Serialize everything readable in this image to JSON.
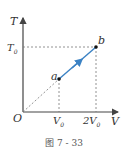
{
  "diagram": {
    "type": "T-V process diagram",
    "axes": {
      "y_label": "T",
      "x_label": "V",
      "origin_label": "O"
    },
    "ticks": {
      "y": [
        {
          "label": "T",
          "subscript": "0"
        }
      ],
      "x": [
        {
          "label": "V",
          "subscript": "0"
        },
        {
          "label": "2V",
          "subscript": "0"
        }
      ]
    },
    "points": [
      {
        "name": "a",
        "V": "V0",
        "T": "T0/2"
      },
      {
        "name": "b",
        "V": "2V0",
        "T": "T0"
      }
    ],
    "process": {
      "from": "a",
      "to": "b",
      "color": "#3b82c4"
    },
    "caption": "图 7 - 33"
  },
  "colors": {
    "axis": "#444444",
    "dashed": "#666666",
    "process_arrow": "#3b82c4",
    "point": "#111111"
  }
}
